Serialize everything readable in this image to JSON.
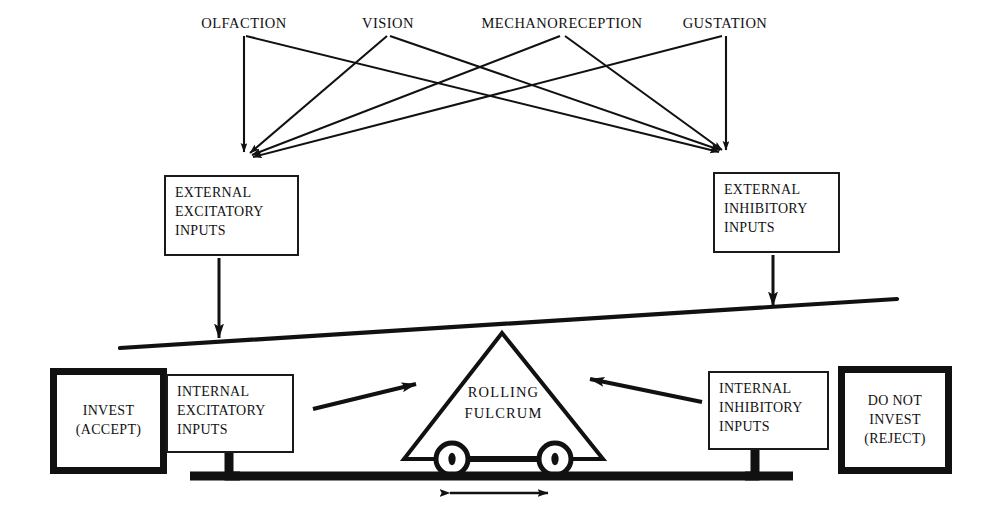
{
  "diagram": {
    "ink_color": "#111111",
    "background_color": "#ffffff"
  },
  "sensory_inputs": {
    "labels": [
      {
        "text": "OLFACTION",
        "x": 244,
        "y": 22
      },
      {
        "text": "VISION",
        "x": 388,
        "y": 22
      },
      {
        "text": "MECHANORECEPTION",
        "x": 562,
        "y": 22
      },
      {
        "text": "GUSTATION",
        "x": 725,
        "y": 22
      }
    ],
    "converge_left": {
      "x": 244,
      "y": 160
    },
    "converge_right": {
      "x": 725,
      "y": 158
    }
  },
  "external_boxes": [
    {
      "name": "external-excitatory-inputs",
      "text": "EXTERNAL\nEXCITATORY\nINPUTS",
      "x": 164,
      "y": 175,
      "w": 135,
      "h": 81
    },
    {
      "name": "external-inhibitory-inputs",
      "text": "EXTERNAL\nINHIBITORY\nINPUTS",
      "x": 713,
      "y": 172,
      "w": 127,
      "h": 81
    }
  ],
  "internal_boxes": [
    {
      "name": "internal-excitatory-inputs",
      "text": "INTERNAL\nEXCITATORY\nINPUTS",
      "x": 166,
      "y": 374,
      "w": 128,
      "h": 79
    },
    {
      "name": "internal-inhibitory-inputs",
      "text": "INTERNAL\nINHIBITORY\nINPUTS",
      "x": 708,
      "y": 371,
      "w": 121,
      "h": 79
    }
  ],
  "decision_boxes": [
    {
      "name": "invest-accept",
      "text": "INVEST\n(ACCEPT)",
      "x": 50,
      "y": 368,
      "w": 117,
      "h": 106
    },
    {
      "name": "do-not-invest-reject",
      "text": "DO NOT\nINVEST\n(REJECT)",
      "x": 838,
      "y": 366,
      "w": 114,
      "h": 108
    }
  ],
  "fulcrum": {
    "label": "ROLLING\nFULCRUM",
    "apex": {
      "x": 502,
      "y": 333
    },
    "base_left": {
      "x": 404,
      "y": 459
    },
    "base_right": {
      "x": 603,
      "y": 459
    },
    "wheels": [
      {
        "cx": 452,
        "cy": 459,
        "r": 16
      },
      {
        "cx": 555,
        "cy": 459,
        "r": 16
      }
    ]
  },
  "lever_beam": {
    "left_end": {
      "x": 120,
      "y": 348
    },
    "right_end": {
      "x": 897,
      "y": 299
    },
    "tilt": "right side raised"
  },
  "rail": {
    "left_x": 190,
    "right_x": 793,
    "y": 476,
    "bracket_up_left_x": 229,
    "bracket_up_right_x": 755
  },
  "motion_arrow": {
    "name": "bidirectional-motion-arrow",
    "x1": 442,
    "x2": 555,
    "y": 493,
    "meaning": "fulcrum rolls left and right"
  },
  "arrows": {
    "external_excitatory_down": {
      "x": 219,
      "y1": 258,
      "y2": 343
    },
    "external_inhibitory_down": {
      "x": 773,
      "y1": 255,
      "y2": 311
    },
    "internal_excitatory_to_fulcrum": {
      "x1": 313,
      "y1": 408,
      "x2": 421,
      "y2": 382
    },
    "internal_inhibitory_to_fulcrum": {
      "x1": 700,
      "y1": 401,
      "x2": 584,
      "y2": 377
    }
  }
}
